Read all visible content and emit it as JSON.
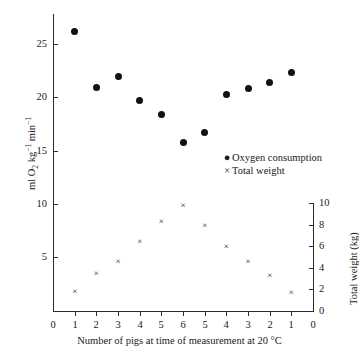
{
  "chart_data": {
    "type": "scatter",
    "title": "",
    "xlabel": "Number of pigs at time of measurement at 20 °C",
    "ylabel_left": "ml O2 kg-1 min-1",
    "ylabel_right": "Total weight (kg)",
    "grid": false,
    "legend_position": "center-right",
    "x_positions": [
      1,
      2,
      3,
      4,
      5,
      6,
      7,
      8,
      9,
      10,
      11
    ],
    "xtick_labels": [
      "0",
      "1",
      "2",
      "3",
      "4",
      "5",
      "6",
      "5",
      "4",
      "3",
      "2",
      "1",
      "0"
    ],
    "xlim": [
      0,
      12
    ],
    "ylim_left": [
      0,
      27
    ],
    "ytick_labels_left": [
      "5",
      "10",
      "15",
      "20",
      "25"
    ],
    "ytick_values_left": [
      5,
      10,
      15,
      20,
      25
    ],
    "ylim_right": [
      0,
      10.8
    ],
    "ytick_labels_right": [
      "0",
      "2",
      "4",
      "6",
      "8",
      "10"
    ],
    "ytick_values_right": [
      0,
      2,
      4,
      6,
      8,
      10
    ],
    "series": [
      {
        "name": "Oxygen consumption",
        "marker": "filled-circle",
        "axis": "left",
        "x": [
          1,
          2,
          3,
          4,
          5,
          6,
          7,
          8,
          9,
          10,
          11
        ],
        "values": [
          26.2,
          20.9,
          22.0,
          19.7,
          18.4,
          15.8,
          16.7,
          20.3,
          20.8,
          21.4,
          22.3
        ]
      },
      {
        "name": "Total weight",
        "marker": "cross",
        "axis": "right",
        "x": [
          1,
          2,
          3,
          4,
          5,
          6,
          7,
          8,
          9,
          10,
          11
        ],
        "values": [
          1.8,
          3.5,
          4.6,
          6.4,
          8.3,
          9.8,
          7.9,
          6.0,
          4.6,
          3.3,
          1.7
        ]
      }
    ],
    "legend": [
      {
        "label": "Oxygen consumption",
        "marker": "●"
      },
      {
        "label": "Total weight",
        "marker": "×"
      }
    ]
  },
  "axis_titles": {
    "x": "Number of pigs at time of measurement at 20 °C",
    "y_right": "Total weight (kg)"
  },
  "colors": {
    "marker": "#111111",
    "axis": "#2b2b2b",
    "background": "#ffffff"
  }
}
